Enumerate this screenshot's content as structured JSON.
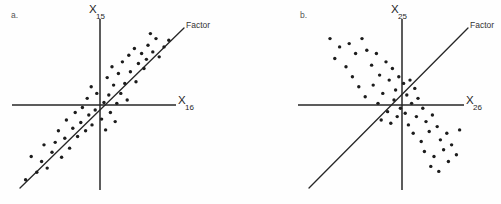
{
  "figure": {
    "width": 501,
    "height": 204,
    "background_color": "#fefefe",
    "ink_color": "#262626"
  },
  "chart_data": [
    {
      "type": "scatter",
      "panel_letter": "a.",
      "title": "",
      "xlabel_base": "X",
      "xlabel_sub": "16",
      "ylabel_base": "X",
      "ylabel_sub": "15",
      "annotation_label": "Factor",
      "correlation": "positive",
      "grid": false,
      "xlim": [
        -1.0,
        1.0
      ],
      "ylim": [
        -1.0,
        1.0
      ],
      "factor_line": {
        "x1": -0.98,
        "y1": -0.96,
        "x2": 0.86,
        "y2": 0.94
      },
      "points": [
        [
          -0.93,
          -0.9
        ],
        [
          -0.79,
          -0.81
        ],
        [
          -0.73,
          -0.68
        ],
        [
          -0.86,
          -0.62
        ],
        [
          -0.66,
          -0.76
        ],
        [
          -0.6,
          -0.57
        ],
        [
          -0.7,
          -0.48
        ],
        [
          -0.56,
          -0.45
        ],
        [
          -0.48,
          -0.63
        ],
        [
          -0.44,
          -0.4
        ],
        [
          -0.52,
          -0.31
        ],
        [
          -0.38,
          -0.52
        ],
        [
          -0.34,
          -0.28
        ],
        [
          -0.42,
          -0.18
        ],
        [
          -0.28,
          -0.38
        ],
        [
          -0.24,
          -0.21
        ],
        [
          -0.31,
          -0.09
        ],
        [
          -0.18,
          -0.31
        ],
        [
          -0.14,
          -0.12
        ],
        [
          -0.22,
          -0.03
        ],
        [
          -0.1,
          -0.24
        ],
        [
          -0.06,
          -0.06
        ],
        [
          -0.16,
          0.08
        ],
        [
          -0.04,
          0.14
        ],
        [
          -0.11,
          0.22
        ],
        [
          0.02,
          -0.17
        ],
        [
          0.07,
          -0.3
        ],
        [
          0.05,
          0.03
        ],
        [
          0.13,
          -0.09
        ],
        [
          0.11,
          0.12
        ],
        [
          0.19,
          -0.2
        ],
        [
          0.21,
          0.02
        ],
        [
          0.17,
          0.24
        ],
        [
          0.26,
          0.14
        ],
        [
          0.09,
          0.33
        ],
        [
          0.23,
          0.38
        ],
        [
          0.31,
          0.26
        ],
        [
          0.34,
          0.06
        ],
        [
          0.15,
          0.46
        ],
        [
          0.28,
          0.52
        ],
        [
          0.38,
          0.4
        ],
        [
          0.45,
          0.28
        ],
        [
          0.36,
          0.6
        ],
        [
          0.48,
          0.5
        ],
        [
          0.43,
          0.68
        ],
        [
          0.55,
          0.44
        ],
        [
          0.52,
          0.62
        ],
        [
          0.6,
          0.72
        ],
        [
          0.58,
          0.55
        ],
        [
          0.66,
          0.64
        ],
        [
          0.7,
          0.8
        ],
        [
          0.74,
          0.58
        ],
        [
          0.8,
          0.7
        ],
        [
          0.63,
          0.86
        ],
        [
          0.86,
          0.78
        ]
      ]
    },
    {
      "type": "scatter",
      "panel_letter": "b.",
      "title": "",
      "xlabel_base": "X",
      "xlabel_sub": "26",
      "ylabel_base": "X",
      "ylabel_sub": "25",
      "annotation_label": "Factor",
      "correlation": "negative",
      "grid": false,
      "xlim": [
        -1.0,
        1.0
      ],
      "ylim": [
        -1.0,
        1.0
      ],
      "factor_line": {
        "x1": -0.95,
        "y1": -0.93,
        "x2": 0.86,
        "y2": 0.94
      },
      "points": [
        [
          -0.9,
          0.8
        ],
        [
          -0.78,
          0.7
        ],
        [
          -0.84,
          0.56
        ],
        [
          -0.66,
          0.74
        ],
        [
          -0.58,
          0.62
        ],
        [
          -0.7,
          0.46
        ],
        [
          -0.5,
          0.8
        ],
        [
          -0.44,
          0.66
        ],
        [
          -0.62,
          0.34
        ],
        [
          -0.54,
          0.22
        ],
        [
          -0.38,
          0.48
        ],
        [
          -0.32,
          0.62
        ],
        [
          -0.46,
          0.1
        ],
        [
          -0.28,
          0.36
        ],
        [
          -0.36,
          0.24
        ],
        [
          -0.2,
          0.52
        ],
        [
          -0.24,
          0.14
        ],
        [
          -0.16,
          0.3
        ],
        [
          -0.12,
          0.44
        ],
        [
          -0.3,
          0.02
        ],
        [
          -0.18,
          -0.08
        ],
        [
          -0.08,
          0.18
        ],
        [
          -0.04,
          0.34
        ],
        [
          -0.1,
          0.06
        ],
        [
          -0.26,
          -0.18
        ],
        [
          -0.14,
          -0.22
        ],
        [
          0.02,
          0.26
        ],
        [
          0.06,
          0.12
        ],
        [
          -0.02,
          -0.04
        ],
        [
          -0.06,
          -0.14
        ],
        [
          0.1,
          0.3
        ],
        [
          0.16,
          0.2
        ],
        [
          0.04,
          -0.1
        ],
        [
          0.12,
          0.02
        ],
        [
          0.2,
          0.08
        ],
        [
          0.08,
          -0.24
        ],
        [
          0.18,
          -0.14
        ],
        [
          0.26,
          -0.04
        ],
        [
          0.14,
          -0.34
        ],
        [
          0.3,
          -0.2
        ],
        [
          0.24,
          -0.44
        ],
        [
          0.38,
          -0.12
        ],
        [
          0.34,
          -0.32
        ],
        [
          0.44,
          -0.26
        ],
        [
          0.28,
          -0.56
        ],
        [
          0.48,
          -0.42
        ],
        [
          0.4,
          -0.62
        ],
        [
          0.56,
          -0.34
        ],
        [
          0.52,
          -0.54
        ],
        [
          0.36,
          -0.74
        ],
        [
          0.62,
          -0.48
        ],
        [
          0.46,
          -0.8
        ],
        [
          0.58,
          -0.68
        ],
        [
          0.68,
          -0.6
        ],
        [
          0.72,
          -0.3
        ]
      ]
    }
  ]
}
